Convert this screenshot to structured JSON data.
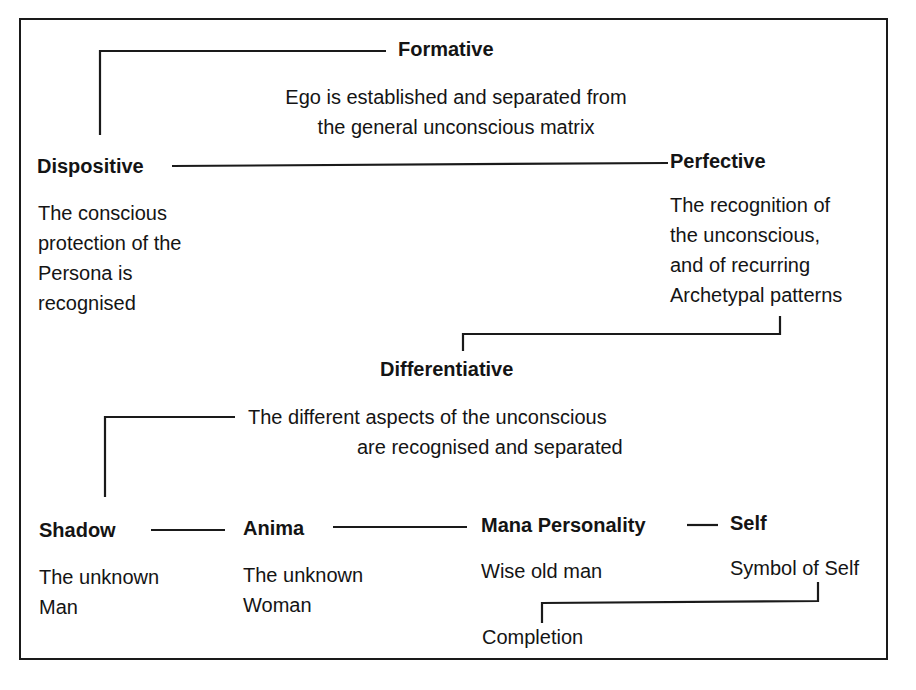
{
  "diagram": {
    "stages": {
      "formative": {
        "title": "Formative",
        "description": "Ego is established and separated from\nthe general unconscious matrix"
      },
      "dispositive": {
        "title": "Dispositive",
        "description": "The conscious\nprotection of the\nPersona is\nrecognised"
      },
      "perfective": {
        "title": "Perfective",
        "description": "The recognition of\nthe unconscious,\nand of recurring\nArchetypal patterns"
      },
      "differentiative": {
        "title": "Differentiative",
        "description_line1": "The different aspects of the unconscious",
        "description_line2": "are recognised and separated"
      }
    },
    "archetypes": [
      {
        "title": "Shadow",
        "description": "The unknown\nMan"
      },
      {
        "title": "Anima",
        "description": "The unknown\nWoman"
      },
      {
        "title": "Mana Personality",
        "description": "Wise old man"
      },
      {
        "title": "Self",
        "description": "Symbol of Self"
      }
    ],
    "completion": "Completion"
  }
}
